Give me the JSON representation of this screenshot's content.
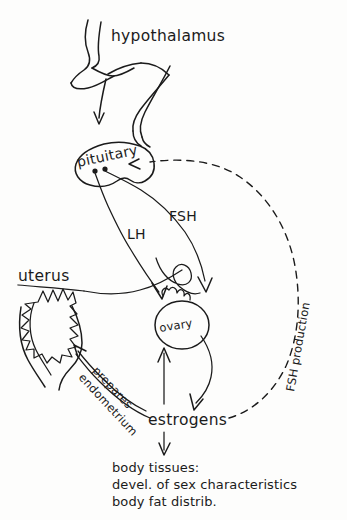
{
  "diagram": {
    "ink_color": "#1b1b1b",
    "background_color": "#fdfdfc"
  },
  "labels": {
    "hypothalamus": "hypothalamus",
    "pituitary": "pituitary",
    "lh": "LH",
    "fsh": "FSH",
    "uterus": "uterus",
    "ovary": "ovary",
    "estrogens": "estrogens",
    "prepares": "prepares",
    "endometrium": "endometrium",
    "fsh_production": "FSH production"
  },
  "outcome_text": {
    "line1": "body tissues:",
    "line2": "devel. of sex characteristics",
    "line3": "body fat distrib."
  }
}
